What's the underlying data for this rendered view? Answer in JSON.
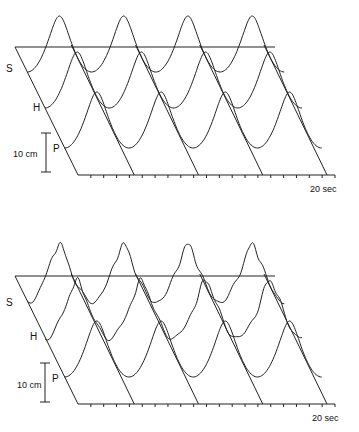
{
  "chart_data": [
    {
      "type": "line",
      "panel": "top",
      "title": "",
      "xlabel": "20 sec",
      "x_range_sec": [
        0,
        20
      ],
      "scale_bar": "10 cm",
      "series": [
        {
          "name": "S",
          "periods": 4,
          "shape": "smooth sinusoid"
        },
        {
          "name": "H",
          "periods": 4,
          "shape": "smooth sinusoid"
        },
        {
          "name": "P",
          "periods": 4,
          "shape": "smooth sinusoid"
        }
      ],
      "grid": false
    },
    {
      "type": "line",
      "panel": "bottom",
      "title": "",
      "xlabel": "20 sec",
      "x_range_sec": [
        0,
        20
      ],
      "scale_bar": "10 cm",
      "series": [
        {
          "name": "S",
          "periods": 4,
          "shape": "irregular sinusoid with ripples"
        },
        {
          "name": "H",
          "periods": 4,
          "shape": "irregular sinusoid with ripples"
        },
        {
          "name": "P",
          "periods": 4,
          "shape": "smooth sinusoid"
        }
      ],
      "grid": false
    }
  ],
  "labels": {
    "top": {
      "s": "S",
      "h": "H",
      "p": "P",
      "scale": "10 cm",
      "time": "20 sec"
    },
    "bottom": {
      "s": "S",
      "h": "H",
      "p": "P",
      "scale": "10 cm",
      "time": "20 sec"
    }
  }
}
